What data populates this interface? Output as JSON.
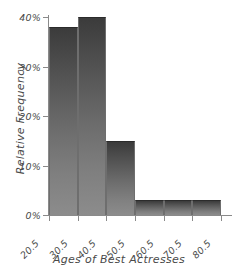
{
  "chart_data": {
    "type": "bar",
    "title": "",
    "subtitle": "",
    "xlabel": "Ages of Best Actresses",
    "ylabel": "Relative Frequency",
    "categories": [
      "20.5-30.5",
      "30.5-40.5",
      "40.5-50.5",
      "50.5-60.5",
      "60.5-70.5",
      "70.5-80.5"
    ],
    "bin_edges": [
      20.5,
      30.5,
      40.5,
      50.5,
      60.5,
      70.5,
      80.5
    ],
    "values": [
      38,
      40,
      15,
      3,
      3,
      3
    ],
    "value_unit": "%",
    "x_tick_labels": [
      "20.5",
      "30.5",
      "40.5",
      "50.5",
      "60.5",
      "70.5",
      "80.5"
    ],
    "y_tick_labels": [
      "0%",
      "10%",
      "20%",
      "30%",
      "40%"
    ],
    "y_tick_values": [
      0,
      10,
      20,
      30,
      40
    ],
    "ylim": [
      0,
      40
    ],
    "xlim": [
      20.5,
      80.5
    ],
    "grid": false,
    "legend": false,
    "legend_position": "none",
    "bar_fill_top_color": "#3b3b3b",
    "bar_fill_bottom_color": "#8c8c8c",
    "bar_edge_color": "#2b2b2b",
    "axis_color": "#8a8a8a",
    "text_color": "#4a4a4a",
    "background_color": "#ffffff"
  }
}
